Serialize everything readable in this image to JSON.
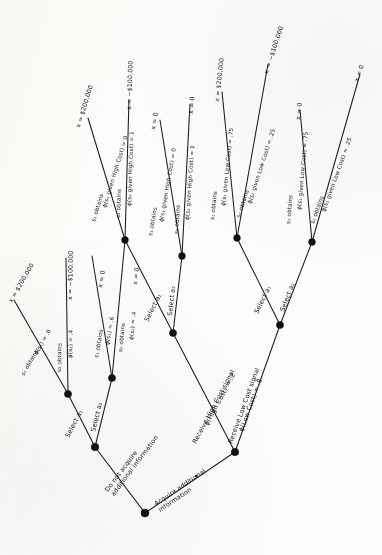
{
  "figure": {
    "type": "decision-tree",
    "orientation": "rotated-90-ccw",
    "background_color": "#fdfdfb",
    "ink_color": "#141414"
  },
  "root": {
    "name": "root-decision-node",
    "branches": [
      {
        "id": "no-info",
        "label": "Do not acquire\nadditional information"
      },
      {
        "id": "acquire",
        "label": "Acquire additional\ninformation"
      }
    ]
  },
  "no_info_subtree": {
    "decision_node": "no-info-decision-node",
    "acts": [
      {
        "id": "a1",
        "label": "Select a₁"
      },
      {
        "id": "a2",
        "label": "Select a₂"
      }
    ],
    "a1_chance": {
      "outcomes": [
        {
          "state": "s₁ obtains",
          "prob": "ϕ(s₁) = .6",
          "payoff": "x = $200,000"
        },
        {
          "state": "s₂ obtains",
          "prob": "ϕ(s₂) = .4",
          "payoff": "x = −$100,000"
        }
      ]
    },
    "a2_chance": {
      "outcomes": [
        {
          "state": "s₁ obtains",
          "prob": "ϕ(s₁) = .6",
          "payoff": "x = 0"
        },
        {
          "state": "s₂ obtains",
          "prob": "ϕ(s₂) = .4",
          "payoff": "x = 0"
        }
      ]
    }
  },
  "acquire_subtree": {
    "signal_node": "signal-chance-node",
    "signals": [
      {
        "id": "high",
        "label": "Receive High Cost signal",
        "prob": "ϕ(High Cost) = .2"
      },
      {
        "id": "low",
        "label": "Receive Low Cost signal",
        "prob": "ϕ(Low Cost) = .8"
      }
    ],
    "high_cost": {
      "decision_node": "high-cost-decision-node",
      "acts": [
        {
          "id": "a1",
          "label": "Select a₁"
        },
        {
          "id": "a2",
          "label": "Select a₂"
        }
      ],
      "a1_chance": {
        "outcomes": [
          {
            "state": "s₁ obtains",
            "prob": "ϕ(s₁ given High Cost) = 0",
            "payoff": "x = $200,000"
          },
          {
            "state": "s₂ obtains",
            "prob": "ϕ(s₂ given High Cost) = 1",
            "payoff": "x = −$100,000"
          }
        ]
      },
      "a2_chance": {
        "outcomes": [
          {
            "state": "s₁ obtains",
            "prob": "ϕ(s₁ given High Cost) = 0",
            "payoff": "x = 0"
          },
          {
            "state": "s₂ obtains",
            "prob": "ϕ(s₂ given High Cost) = 1",
            "payoff": "x = 0"
          }
        ]
      }
    },
    "low_cost": {
      "decision_node": "low-cost-decision-node",
      "acts": [
        {
          "id": "a1",
          "label": "Select a₁"
        },
        {
          "id": "a2",
          "label": "Select a₂"
        }
      ],
      "a1_chance": {
        "outcomes": [
          {
            "state": "s₁ obtains",
            "prob": "ϕ(s₁ given Low Cost) = .75",
            "payoff": "x = $200,000"
          },
          {
            "state": "s₂ obtains",
            "prob": "ϕ(s₂ given Low Cost) = .25",
            "payoff": "x = −$100,000"
          }
        ]
      },
      "a2_chance": {
        "outcomes": [
          {
            "state": "s₁ obtains",
            "prob": "ϕ(s₁ given Low Cost) = .75",
            "payoff": "x = 0"
          },
          {
            "state": "s₂ obtains",
            "prob": "ϕ(s₂ given Low Cost) = .25",
            "payoff": "x = 0"
          }
        ]
      }
    }
  }
}
